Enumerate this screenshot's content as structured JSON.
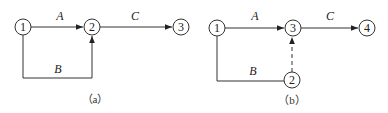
{
  "diagram_a": {
    "caption": "（a）",
    "nodes": [
      {
        "id": "1",
        "label": "1"
      },
      {
        "id": "2",
        "label": "2"
      },
      {
        "id": "3",
        "label": "3"
      }
    ],
    "edges": [
      {
        "label": "A",
        "from": "1",
        "to": "2",
        "style": "solid"
      },
      {
        "label": "B",
        "from": "1",
        "to": "2",
        "style": "solid"
      },
      {
        "label": "C",
        "from": "2",
        "to": "3",
        "style": "solid"
      }
    ]
  },
  "diagram_b": {
    "caption": "（b）",
    "nodes": [
      {
        "id": "1",
        "label": "1"
      },
      {
        "id": "2",
        "label": "2"
      },
      {
        "id": "3",
        "label": "3"
      },
      {
        "id": "4",
        "label": "4"
      }
    ],
    "edges": [
      {
        "label": "A",
        "from": "1",
        "to": "3",
        "style": "solid"
      },
      {
        "label": "B",
        "from": "1",
        "to": "2",
        "style": "solid"
      },
      {
        "label": "",
        "from": "2",
        "to": "3",
        "style": "dashed"
      },
      {
        "label": "C",
        "from": "3",
        "to": "4",
        "style": "solid"
      }
    ]
  }
}
